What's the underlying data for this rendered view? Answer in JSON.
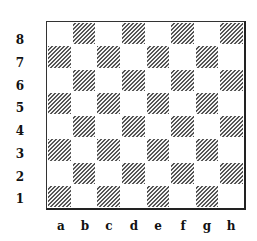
{
  "diagram": {
    "type": "chessboard",
    "ranks": [
      "8",
      "7",
      "6",
      "5",
      "4",
      "3",
      "2",
      "1"
    ],
    "files": [
      "a",
      "b",
      "c",
      "d",
      "e",
      "f",
      "g",
      "h"
    ],
    "square_colors": {
      "light": "#ffffff",
      "dark_hatch_line": "#555555",
      "border": "#222222"
    },
    "dark_square_pattern": "diagonal-hatch",
    "a1_color": "dark",
    "pieces": []
  }
}
